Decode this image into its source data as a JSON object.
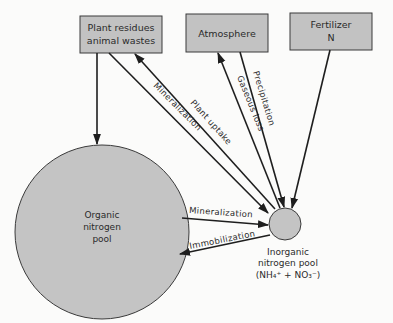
{
  "diagram": {
    "sources": [
      {
        "id": "plant",
        "lines": [
          "Plant residues",
          "animal wastes"
        ]
      },
      {
        "id": "atmosphere",
        "lines": [
          "Atmosphere"
        ]
      },
      {
        "id": "fertilizer",
        "lines": [
          "Fertilizer",
          "N"
        ]
      }
    ],
    "pools": {
      "organic": {
        "lines": [
          "Organic",
          "nitrogen",
          "pool"
        ]
      },
      "inorganic": {
        "lines": [
          "Inorganic",
          "nitrogen pool",
          "(NH₄⁺ + NO₃⁻)"
        ]
      }
    },
    "flows": {
      "plant_uptake": "Plant uptake",
      "mineralization_to_plant": "Mineralization",
      "gaseous_loss": "Gaseous loss",
      "precipitation": "Precipitation",
      "mineralization": "Mineralization",
      "immobilization": "Immobilization"
    },
    "colors": {
      "box_fill": "#c2c2c2",
      "pool_fill": "#c4c4c4",
      "line": "#1e1e1e",
      "background": "#fbfbfa"
    }
  }
}
